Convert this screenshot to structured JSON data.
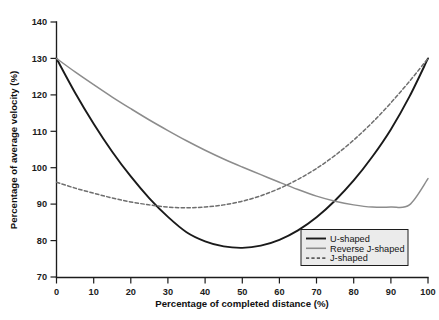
{
  "chart_data": {
    "type": "line",
    "title": "",
    "xlabel": "Percentage of completed distance (%)",
    "ylabel": "Percentage of average velocity (%)",
    "xlim": [
      0,
      100
    ],
    "ylim": [
      70,
      140
    ],
    "xticks": [
      "0",
      "10",
      "20",
      "30",
      "40",
      "50",
      "60",
      "70",
      "80",
      "90",
      "100"
    ],
    "yticks": [
      "70",
      "80",
      "90",
      "100",
      "110",
      "120",
      "130",
      "140"
    ],
    "grid": false,
    "legend_position": "lower right",
    "x": [
      0,
      5,
      10,
      15,
      20,
      25,
      30,
      35,
      40,
      45,
      50,
      55,
      60,
      65,
      70,
      75,
      80,
      85,
      90,
      95,
      100
    ],
    "series": [
      {
        "name": "U-shaped",
        "color": "#1a1a1a",
        "style": "solid",
        "values": [
          130.0,
          120.6,
          112.1,
          104.4,
          97.6,
          91.6,
          86.5,
          82.3,
          79.8,
          78.4,
          78.0,
          78.6,
          80.2,
          82.8,
          86.4,
          91.0,
          96.5,
          103.0,
          110.5,
          119.5,
          130.0
        ]
      },
      {
        "name": "Reverse J-shaped",
        "color": "#8c8c8c",
        "style": "solid",
        "values": [
          130.0,
          126.3,
          122.8,
          119.4,
          116.2,
          113.1,
          110.2,
          107.4,
          104.8,
          102.4,
          100.2,
          98.1,
          96.0,
          94.0,
          92.2,
          90.8,
          89.8,
          89.2,
          89.2,
          89.8,
          97.0
        ]
      },
      {
        "name": "J-shaped",
        "color": "#6e6e6e",
        "style": "dashed",
        "values": [
          96.0,
          94.4,
          93.0,
          91.7,
          90.6,
          89.8,
          89.2,
          89.0,
          89.2,
          89.8,
          90.8,
          92.3,
          94.3,
          96.8,
          99.8,
          103.4,
          107.6,
          112.4,
          117.8,
          123.7,
          130.0
        ]
      }
    ],
    "annotations": {
      "u_shaped_minimum": {
        "x": 50,
        "y": 78
      },
      "reverse_j_shaped_minimum": {
        "x": 70,
        "y": 89
      },
      "j_shaped_minimum": {
        "x": 30,
        "y": 89
      },
      "common_start": {
        "x": 0,
        "y": 130
      },
      "common_end": {
        "x": 100,
        "y": 130
      }
    }
  },
  "legend": {
    "entries": [
      {
        "label": "U-shaped"
      },
      {
        "label": "Reverse J-shaped"
      },
      {
        "label": "J-shaped"
      }
    ]
  },
  "caption": {
    "text": ""
  }
}
